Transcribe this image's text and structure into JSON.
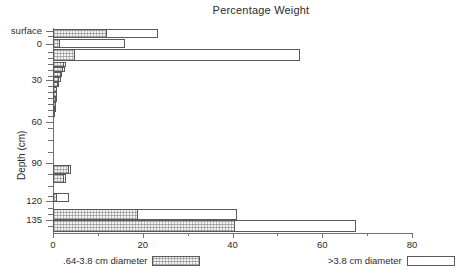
{
  "chart_data": {
    "type": "bar",
    "orientation": "horizontal",
    "title": "Percentage Weight",
    "xlabel": "",
    "ylabel": "Depth (cm)",
    "xlim": [
      0,
      80
    ],
    "ylim_labels": [
      "surface",
      "0",
      "30",
      "60",
      "90",
      "120",
      "135"
    ],
    "xticks": [
      0,
      20,
      40,
      60,
      80
    ],
    "xtick_labels": [
      "0",
      "20",
      "40",
      "60",
      "80"
    ],
    "yticks": [
      0,
      30,
      60,
      90,
      120,
      135
    ],
    "ytick_labels": [
      "0",
      "30",
      "60",
      "90",
      "120",
      "135"
    ],
    "y_top_label": "surface",
    "grid": false,
    "legend_position": "below",
    "series": [
      {
        "name": ".64-3.8 cm diameter",
        "style": "hatched",
        "values": [
          12.0,
          1.5,
          5.0,
          2.5,
          2.2,
          1.8,
          1.4,
          1.1,
          0.9,
          0.8,
          0.7,
          0.6,
          0.5,
          0.4,
          3.5,
          2.5,
          1.0,
          19.0,
          40.5
        ]
      },
      {
        "name": ">3.8 cm diameter",
        "style": "open",
        "values": [
          23.5,
          16.0,
          55.0,
          3.0,
          2.6,
          2.1,
          1.7,
          1.3,
          1.0,
          0.9,
          0.8,
          0.7,
          0.6,
          0.5,
          4.0,
          3.0,
          3.5,
          41.0,
          67.5
        ]
      }
    ],
    "depth_bands": [
      "surface",
      "0",
      "5",
      "10",
      "15",
      "20",
      "25",
      "30",
      "35",
      "40",
      "50",
      "60",
      "70",
      "80",
      "90",
      "100",
      "110",
      "120",
      "135"
    ]
  },
  "legend": {
    "entries": [
      {
        "label": ".64-3.8 cm diameter",
        "style": "hatched"
      },
      {
        "label": ">3.8 cm diameter",
        "style": "open"
      }
    ]
  },
  "axes": {
    "y_title": "Depth (cm)",
    "y_top_label": "surface"
  }
}
